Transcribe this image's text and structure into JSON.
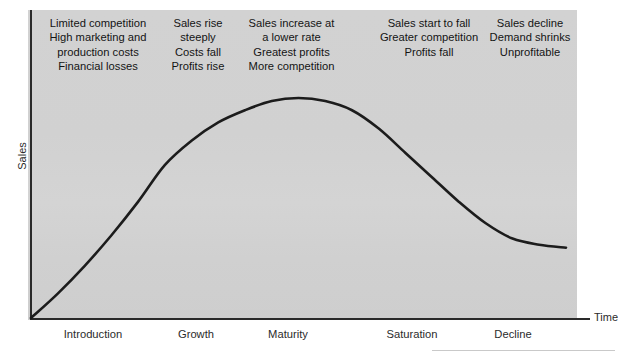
{
  "chart_data": {
    "type": "line",
    "title": "",
    "xlabel": "Time",
    "ylabel": "Sales",
    "grid": false,
    "legend": false,
    "x_tick_labels": [
      "Introduction",
      "Growth",
      "Maturity",
      "Saturation",
      "Decline"
    ],
    "y_tick_labels": [],
    "xlim": [
      0,
      100
    ],
    "ylim": [
      0,
      100
    ],
    "series": [
      {
        "name": "Sales",
        "x": [
          0,
          5,
          10,
          15,
          20,
          25,
          30,
          35,
          40,
          45,
          50,
          55,
          60,
          65,
          70,
          75,
          80,
          85,
          90,
          95,
          100
        ],
        "values": [
          0,
          8,
          17,
          27,
          38,
          50,
          58,
          64,
          68,
          71,
          72,
          71,
          68,
          62,
          54,
          46,
          38,
          31,
          26,
          24,
          23
        ]
      }
    ],
    "annotations": [
      {
        "stage": "Introduction",
        "lines": [
          "Limited competition",
          "High marketing and",
          "production costs",
          "Financial losses"
        ]
      },
      {
        "stage": "Growth",
        "lines": [
          "Sales rise",
          "steeply",
          "Costs fall",
          "Profits rise"
        ]
      },
      {
        "stage": "Maturity",
        "lines": [
          "Sales increase at",
          "a lower rate",
          "Greatest profits",
          "More competition"
        ]
      },
      {
        "stage": "Saturation",
        "lines": [
          "Sales start to fall",
          "Greater competition",
          "Profits fall"
        ]
      },
      {
        "stage": "Decline",
        "lines": [
          "Sales decline",
          "Demand shrinks",
          "Unprofitable"
        ]
      }
    ]
  },
  "axes": {
    "y_title": "Sales",
    "x_title": "Time"
  },
  "stage_labels": {
    "introduction": "Introduction",
    "growth": "Growth",
    "maturity": "Maturity",
    "saturation": "Saturation",
    "decline": "Decline"
  },
  "annotations": {
    "introduction": {
      "line1": "Limited competition",
      "line2": "High marketing and",
      "line3": "production costs",
      "line4": "Financial losses"
    },
    "growth": {
      "line1": "Sales rise",
      "line2": "steeply",
      "line3": "Costs fall",
      "line4": "Profits rise"
    },
    "maturity": {
      "line1": "Sales increase at",
      "line2": "a lower rate",
      "line3": "Greatest profits",
      "line4": "More competition"
    },
    "saturation": {
      "line1": "Sales start to fall",
      "line2": "Greater competition",
      "line3": "Profits fall"
    },
    "decline": {
      "line1": "Sales decline",
      "line2": "Demand shrinks",
      "line3": "Unprofitable"
    }
  },
  "colors": {
    "plot_background": "#d0d0d0",
    "page_background": "#ffffff",
    "curve": "#1c1c1c",
    "axis": "#2a2a2a",
    "text": "#141414"
  }
}
